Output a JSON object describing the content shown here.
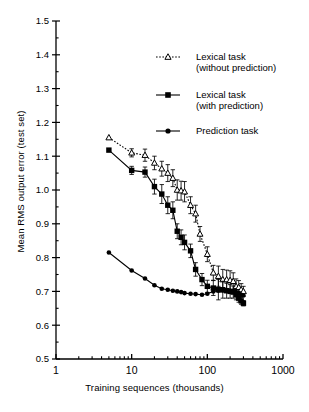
{
  "chart_data": {
    "type": "line",
    "title": "",
    "xlabel": "Training sequences (thousands)",
    "ylabel": "Mean RMS output error (test set)",
    "xscale": "log",
    "xlim": [
      1,
      1000
    ],
    "ylim": [
      0.5,
      1.5
    ],
    "xticks": [
      1,
      10,
      100,
      1000
    ],
    "xticklabels": [
      "1",
      "10",
      "100",
      "1000"
    ],
    "yticks": [
      0.5,
      0.6,
      0.7,
      0.8,
      0.9,
      1.0,
      1.1,
      1.2,
      1.3,
      1.4,
      1.5
    ],
    "yticklabels": [
      "0.5",
      "0.6",
      "0.7",
      "0.8",
      "0.9",
      "1.0",
      "1.1",
      "1.2",
      "1.3",
      "1.4",
      "1.5"
    ],
    "grid": false,
    "legend_position": "upper right",
    "series": [
      {
        "name": "Lexical task (without prediction)",
        "marker": "open-triangle",
        "linestyle": "dotted",
        "color": "#000000",
        "points": [
          {
            "x": 5,
            "y": 1.155,
            "err": 0.0
          },
          {
            "x": 10,
            "y": 1.11,
            "err": 0.012
          },
          {
            "x": 15,
            "y": 1.103,
            "err": 0.018
          },
          {
            "x": 20,
            "y": 1.08,
            "err": 0.02
          },
          {
            "x": 25,
            "y": 1.063,
            "err": 0.022
          },
          {
            "x": 30,
            "y": 1.05,
            "err": 0.025
          },
          {
            "x": 35,
            "y": 1.035,
            "err": 0.025
          },
          {
            "x": 40,
            "y": 1.0,
            "err": 0.03
          },
          {
            "x": 45,
            "y": 0.998,
            "err": 0.028
          },
          {
            "x": 50,
            "y": 0.995,
            "err": 0.03
          },
          {
            "x": 60,
            "y": 0.955,
            "err": 0.025
          },
          {
            "x": 70,
            "y": 0.93,
            "err": 0.025
          },
          {
            "x": 80,
            "y": 0.87,
            "err": 0.022
          },
          {
            "x": 100,
            "y": 0.81,
            "err": 0.022
          },
          {
            "x": 120,
            "y": 0.755,
            "err": 0.022
          },
          {
            "x": 140,
            "y": 0.745,
            "err": 0.03
          },
          {
            "x": 160,
            "y": 0.735,
            "err": 0.03
          },
          {
            "x": 180,
            "y": 0.735,
            "err": 0.028
          },
          {
            "x": 200,
            "y": 0.733,
            "err": 0.028
          },
          {
            "x": 220,
            "y": 0.73,
            "err": 0.025
          },
          {
            "x": 240,
            "y": 0.715,
            "err": 0.022
          },
          {
            "x": 260,
            "y": 0.712,
            "err": 0.02
          },
          {
            "x": 280,
            "y": 0.705,
            "err": 0.018
          },
          {
            "x": 300,
            "y": 0.7,
            "err": 0.015
          }
        ]
      },
      {
        "name": "Lexical task (with prediction)",
        "marker": "filled-square",
        "linestyle": "solid",
        "color": "#000000",
        "points": [
          {
            "x": 5,
            "y": 1.118,
            "err": 0.0
          },
          {
            "x": 10,
            "y": 1.058,
            "err": 0.012
          },
          {
            "x": 15,
            "y": 1.053,
            "err": 0.015
          },
          {
            "x": 20,
            "y": 1.01,
            "err": 0.022
          },
          {
            "x": 25,
            "y": 0.988,
            "err": 0.028
          },
          {
            "x": 30,
            "y": 0.955,
            "err": 0.025
          },
          {
            "x": 35,
            "y": 0.94,
            "err": 0.025
          },
          {
            "x": 40,
            "y": 0.878,
            "err": 0.022
          },
          {
            "x": 45,
            "y": 0.86,
            "err": 0.022
          },
          {
            "x": 50,
            "y": 0.845,
            "err": 0.022
          },
          {
            "x": 60,
            "y": 0.82,
            "err": 0.02
          },
          {
            "x": 70,
            "y": 0.765,
            "err": 0.02
          },
          {
            "x": 85,
            "y": 0.735,
            "err": 0.018
          },
          {
            "x": 100,
            "y": 0.715,
            "err": 0.018
          },
          {
            "x": 120,
            "y": 0.71,
            "err": 0.022
          },
          {
            "x": 140,
            "y": 0.705,
            "err": 0.03
          },
          {
            "x": 160,
            "y": 0.705,
            "err": 0.025
          },
          {
            "x": 180,
            "y": 0.702,
            "err": 0.022
          },
          {
            "x": 200,
            "y": 0.7,
            "err": 0.02
          },
          {
            "x": 220,
            "y": 0.698,
            "err": 0.018
          },
          {
            "x": 240,
            "y": 0.69,
            "err": 0.015
          },
          {
            "x": 260,
            "y": 0.68,
            "err": 0.012
          },
          {
            "x": 280,
            "y": 0.672,
            "err": 0.01
          },
          {
            "x": 300,
            "y": 0.665,
            "err": 0.008
          }
        ]
      },
      {
        "name": "Prediction task",
        "marker": "filled-circle",
        "linestyle": "solid",
        "color": "#000000",
        "points": [
          {
            "x": 5,
            "y": 0.815,
            "err": 0
          },
          {
            "x": 10,
            "y": 0.762,
            "err": 0
          },
          {
            "x": 15,
            "y": 0.738,
            "err": 0
          },
          {
            "x": 20,
            "y": 0.718,
            "err": 0
          },
          {
            "x": 25,
            "y": 0.708,
            "err": 0
          },
          {
            "x": 30,
            "y": 0.705,
            "err": 0
          },
          {
            "x": 35,
            "y": 0.702,
            "err": 0
          },
          {
            "x": 40,
            "y": 0.7,
            "err": 0
          },
          {
            "x": 45,
            "y": 0.698,
            "err": 0
          },
          {
            "x": 50,
            "y": 0.695,
            "err": 0
          },
          {
            "x": 60,
            "y": 0.693,
            "err": 0
          },
          {
            "x": 70,
            "y": 0.692,
            "err": 0
          },
          {
            "x": 85,
            "y": 0.69,
            "err": 0
          },
          {
            "x": 100,
            "y": 0.693,
            "err": 0
          },
          {
            "x": 120,
            "y": 0.7,
            "err": 0
          },
          {
            "x": 140,
            "y": 0.702,
            "err": 0
          },
          {
            "x": 160,
            "y": 0.703,
            "err": 0
          },
          {
            "x": 180,
            "y": 0.703,
            "err": 0
          },
          {
            "x": 200,
            "y": 0.702,
            "err": 0
          },
          {
            "x": 220,
            "y": 0.7,
            "err": 0
          },
          {
            "x": 240,
            "y": 0.698,
            "err": 0
          },
          {
            "x": 260,
            "y": 0.695,
            "err": 0
          },
          {
            "x": 280,
            "y": 0.69,
            "err": 0
          },
          {
            "x": 300,
            "y": 0.688,
            "err": 0
          }
        ]
      }
    ]
  },
  "legend": {
    "entries": [
      {
        "line1": "Lexical task",
        "line2": "(without prediction)",
        "marker": "open-triangle",
        "linestyle": "dotted"
      },
      {
        "line1": "Lexical task",
        "line2": "(with prediction)",
        "marker": "filled-square",
        "linestyle": "solid"
      },
      {
        "line1": "Prediction task",
        "line2": "",
        "marker": "filled-circle",
        "linestyle": "solid"
      }
    ]
  },
  "style": {
    "axis_color": "#000000",
    "background": "#ffffff",
    "marker_color": "#000000"
  }
}
